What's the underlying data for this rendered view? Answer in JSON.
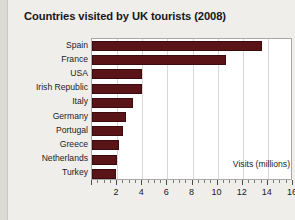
{
  "chart_data": {
    "type": "bar",
    "orientation": "horizontal",
    "title": "Countries visited by UK tourists (2008)",
    "xlabel": "Visits (millions)",
    "ylabel": "",
    "categories": [
      "Spain",
      "France",
      "USA",
      "Irish Republic",
      "Italy",
      "Germany",
      "Portugal",
      "Greece",
      "Netherlands",
      "Turkey"
    ],
    "values": [
      13.5,
      10.7,
      4.0,
      4.0,
      3.3,
      2.7,
      2.5,
      2.15,
      2.0,
      1.95
    ],
    "xlim": [
      0,
      16
    ],
    "xticks": [
      0,
      2,
      4,
      6,
      8,
      10,
      12,
      14,
      16
    ],
    "xtick_labels": [
      "",
      "2",
      "4",
      "6",
      "8",
      "10",
      "12",
      "14",
      "16"
    ],
    "minor_tick_step": 0.5,
    "grid": "vertical",
    "legend": "none",
    "bar_color": "#5a1418",
    "bar_edge_color": "#3a0c10",
    "plot_background": "#ffffff",
    "gridline_color": "#d8d8d8",
    "page_background": "#f0eeeb"
  }
}
